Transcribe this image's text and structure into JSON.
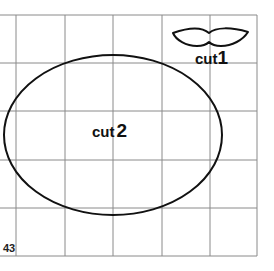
{
  "diagram": {
    "grid": {
      "x_lines": [
        16,
        65,
        113,
        162,
        210,
        257
      ],
      "y_lines": [
        15,
        63,
        111,
        160,
        208,
        256
      ],
      "left_edge": 0,
      "line_color": "#8a8a8a"
    },
    "shapes": [
      {
        "id": "cut1",
        "type": "mustache",
        "label_word": "cut",
        "label_number": "1"
      },
      {
        "id": "cut2",
        "type": "ellipse",
        "cx": 113,
        "cy": 135,
        "rx": 109,
        "ry": 80,
        "label_word": "cut",
        "label_number": "2"
      }
    ],
    "page_number": "43",
    "stroke_color": "#111111"
  }
}
